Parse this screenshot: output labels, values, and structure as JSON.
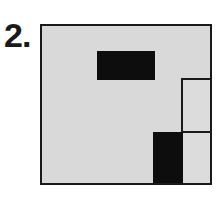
{
  "figure": {
    "label": "2.",
    "colors": {
      "fill": "#d9d9d9",
      "block": "#0d0d0d",
      "border": "#1a1a1a"
    }
  }
}
